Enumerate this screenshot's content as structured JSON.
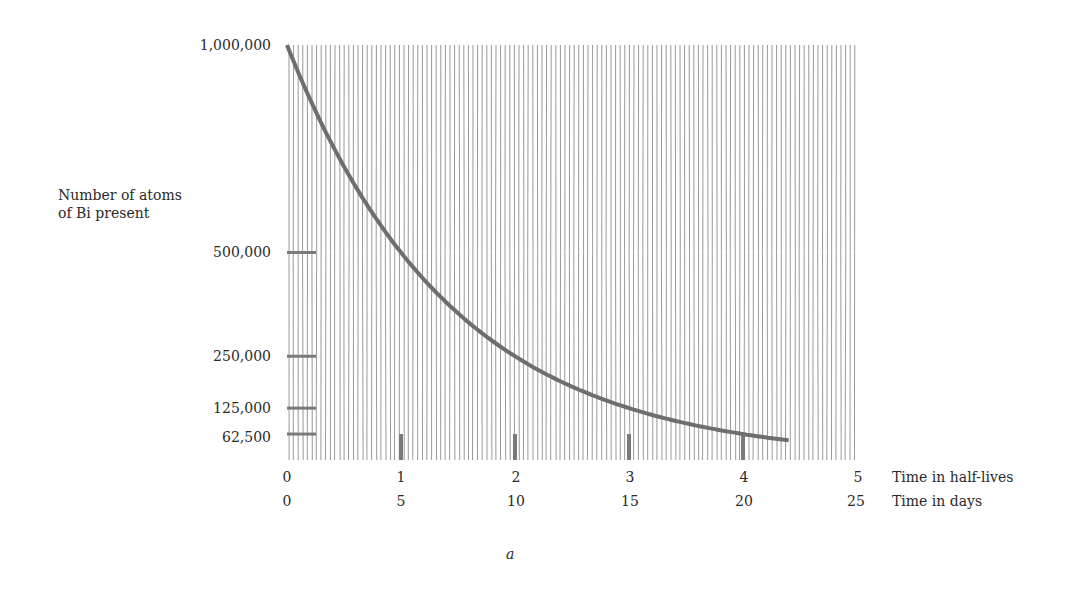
{
  "chart_data": {
    "type": "line",
    "title": "",
    "caption": "a",
    "ylabel": "Number of atoms of Bi present",
    "ylabel_lines": [
      "Number of atoms",
      "of Bi present"
    ],
    "xlabel_primary": "Time in half-lives",
    "xlabel_secondary": "Time in days",
    "x_half_lives_ticks": [
      "0",
      "1",
      "2",
      "3",
      "4",
      "5"
    ],
    "x_days_ticks": [
      "0",
      "5",
      "10",
      "15",
      "20",
      "25"
    ],
    "y_ticks": [
      {
        "label": "1,000,000",
        "value": 1000000
      },
      {
        "label": "500,000",
        "value": 500000
      },
      {
        "label": "250,000",
        "value": 250000
      },
      {
        "label": "125,000",
        "value": 125000
      },
      {
        "label": "62,500",
        "value": 62500
      }
    ],
    "xlim": [
      0,
      5
    ],
    "ylim": [
      0,
      1000000
    ],
    "grid": "vertical hatch lines",
    "series": [
      {
        "name": "Bi atoms remaining",
        "x_half_lives": [
          0,
          0.5,
          1,
          1.5,
          2,
          2.5,
          3,
          3.5,
          4,
          4.4
        ],
        "values": [
          1000000,
          707107,
          500000,
          353553,
          250000,
          176777,
          125000,
          88388,
          62500,
          47366
        ]
      }
    ],
    "half_life_markers": [
      1,
      2,
      3,
      4
    ]
  },
  "labels": {
    "y_title_line1": "Number of atoms",
    "y_title_line2": "of Bi present",
    "y_1000000": "1,000,000",
    "y_500000": "500,000",
    "y_250000": "250,000",
    "y_125000": "125,000",
    "y_62500": "62,500",
    "x_hl_0": "0",
    "x_hl_1": "1",
    "x_hl_2": "2",
    "x_hl_3": "3",
    "x_hl_4": "4",
    "x_hl_5": "5",
    "x_d_0": "0",
    "x_d_5": "5",
    "x_d_10": "10",
    "x_d_15": "15",
    "x_d_20": "20",
    "x_d_25": "25",
    "x_title_hl": "Time in half-lives",
    "x_title_days": "Time in days",
    "caption": "a"
  },
  "colors": {
    "hatch": "#9a9a9a",
    "curve": "#6e6e6e",
    "tick": "#7a7a7a",
    "text": "#2a2a2a"
  }
}
